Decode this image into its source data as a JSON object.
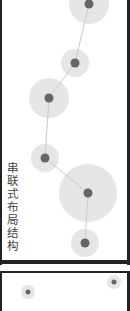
{
  "diagram": {
    "title": "串联式布局结构",
    "colors": {
      "halo": "#e6e6e6",
      "node": "#666666",
      "edge": "#cccccc",
      "border": "#222222"
    },
    "nodes": [
      {
        "id": 1,
        "x": 89,
        "y": 4,
        "halo_r": 20
      },
      {
        "id": 2,
        "x": 75,
        "y": 63,
        "halo_r": 14
      },
      {
        "id": 3,
        "x": 49,
        "y": 98,
        "halo_r": 20
      },
      {
        "id": 4,
        "x": 45,
        "y": 158,
        "halo_r": 14
      },
      {
        "id": 5,
        "x": 88,
        "y": 193,
        "halo_r": 29
      },
      {
        "id": 6,
        "x": 85,
        "y": 243,
        "halo_r": 14
      }
    ],
    "edges": [
      [
        1,
        2
      ],
      [
        2,
        3
      ],
      [
        3,
        4
      ],
      [
        4,
        5
      ],
      [
        5,
        6
      ]
    ],
    "bottom_panel_nodes": [
      {
        "x": 28,
        "y": 292,
        "halo_r": 7
      },
      {
        "x": 114,
        "y": 282,
        "halo_r": 7
      }
    ]
  }
}
